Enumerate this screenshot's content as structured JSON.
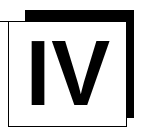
{
  "logo": {
    "numeral": "IV",
    "alt_label": "IV",
    "colors": {
      "foreground": "#000000",
      "background": "#ffffff",
      "outline": "#000000"
    },
    "shapes": {
      "filled_square_label": "black square",
      "outlined_panel_label": "white outlined panel"
    }
  },
  "canvas": {
    "width": 146,
    "height": 137
  }
}
